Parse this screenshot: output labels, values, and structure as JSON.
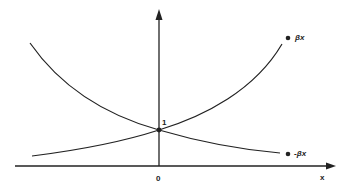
{
  "diagram": {
    "type": "exponential-curves",
    "colors": {
      "stroke": "#222222",
      "background": "#ffffff"
    },
    "axes": {
      "x_label": "x",
      "origin_label": "0",
      "intercept_label": "1"
    },
    "curves": [
      {
        "name": "growth",
        "label": "βx"
      },
      {
        "name": "decay",
        "label": "-βx"
      }
    ]
  }
}
